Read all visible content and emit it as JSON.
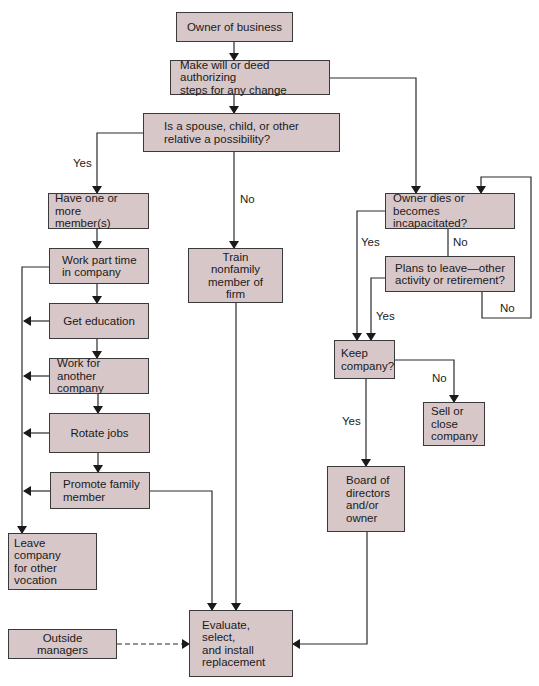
{
  "nodes": {
    "owner": "Owner of business",
    "make_will": "Make will or deed authorizing\nsteps for any change",
    "relative": "Is a spouse, child, or other\nrelative a possibility?",
    "have_members": "Have one or more\nmember(s)",
    "part_time": "Work part time\nin company",
    "education": "Get education",
    "another_company": "Work for another\ncompany",
    "rotate": "Rotate jobs",
    "promote": "Promote family\nmember",
    "leave_company": "Leave company\nfor other\nvocation",
    "train_nonfamily": "Train nonfamily\nmember of firm",
    "owner_dies": "Owner dies or becomes\nincapacitated?",
    "plans_leave": "Plans to leave—other\nactivity or retirement?",
    "keep_company": "Keep\ncompany?",
    "sell_close": "Sell or\nclose\ncompany",
    "board": "Board of\ndirectors\nand/or\nowner",
    "evaluate": "Evaluate, select,\nand install\nreplacement",
    "outside_managers": "Outside managers"
  },
  "labels": {
    "relative_yes": "Yes",
    "relative_no": "No",
    "dies_yes": "Yes",
    "dies_no": "No",
    "plans_yes": "Yes",
    "plans_no": "No",
    "keep_no": "No",
    "keep_yes": "Yes"
  }
}
